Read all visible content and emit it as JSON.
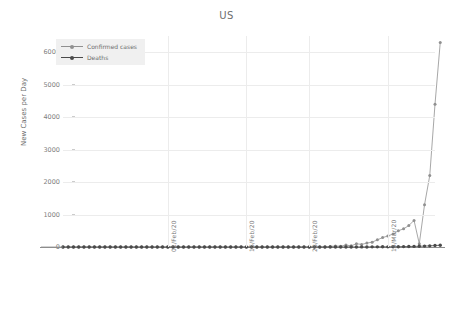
{
  "chart_data": {
    "type": "line",
    "title": "US",
    "xlabel": "",
    "ylabel": "New Cases per Day",
    "ylim": [
      0,
      6500
    ],
    "yticks": [
      0,
      1000,
      2000,
      3000,
      4000,
      5000,
      6000
    ],
    "ytick_labels": [
      "0",
      "1000",
      "2000",
      "3000",
      "4000",
      "5000",
      "6000"
    ],
    "xtick_labels": [
      "01/Feb/20",
      "16/Feb/20",
      "28/Feb/20",
      "14/Mar/20"
    ],
    "xtick_positions": [
      20,
      35,
      47,
      62
    ],
    "grid": true,
    "legend_position": "upper-left",
    "n_points": 72,
    "series": [
      {
        "name": "Confirmed cases",
        "color": "#909090",
        "marker": "circle",
        "values": [
          0,
          0,
          0,
          0,
          1,
          0,
          1,
          0,
          0,
          0,
          1,
          0,
          0,
          2,
          0,
          0,
          0,
          0,
          0,
          0,
          0,
          0,
          0,
          0,
          0,
          0,
          0,
          0,
          0,
          0,
          0,
          0,
          0,
          0,
          0,
          0,
          0,
          0,
          0,
          0,
          0,
          0,
          0,
          0,
          0,
          0,
          0,
          0,
          0,
          0,
          0,
          18,
          30,
          25,
          60,
          35,
          100,
          80,
          120,
          150,
          220,
          290,
          340,
          400,
          500,
          560,
          660,
          820,
          100,
          1300,
          2200,
          4400,
          6300
        ]
      },
      {
        "name": "Deaths",
        "color": "#4a4a4a",
        "marker": "circle",
        "values": [
          0,
          0,
          0,
          0,
          0,
          0,
          0,
          0,
          0,
          0,
          0,
          0,
          0,
          0,
          0,
          0,
          0,
          0,
          0,
          0,
          0,
          0,
          0,
          0,
          0,
          0,
          0,
          0,
          0,
          0,
          0,
          0,
          0,
          0,
          0,
          0,
          0,
          0,
          0,
          0,
          0,
          0,
          0,
          0,
          0,
          0,
          0,
          0,
          0,
          0,
          0,
          0,
          0,
          0,
          1,
          2,
          1,
          3,
          2,
          4,
          5,
          6,
          4,
          8,
          10,
          12,
          15,
          18,
          22,
          28,
          35,
          45,
          55
        ]
      }
    ]
  },
  "legend": {
    "items": [
      {
        "label": "Confirmed cases"
      },
      {
        "label": "Deaths"
      }
    ]
  },
  "colors": {
    "confirmed": "#909090",
    "deaths": "#4a4a4a",
    "grid": "#ececec",
    "axis": "#8c8c8c",
    "text": "#6e6e6e",
    "legend_background": "#f0f0f0"
  }
}
